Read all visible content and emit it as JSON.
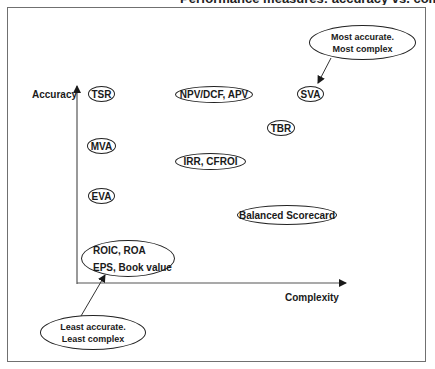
{
  "title_cropped": "Performance measures: accuracy vs. complexity",
  "axes": {
    "y_label": "Accuracy",
    "x_label": "Complexity"
  },
  "nodes": [
    {
      "id": "tsr",
      "label": "TSR"
    },
    {
      "id": "npv",
      "label": "NPV/DCF, APV"
    },
    {
      "id": "sva",
      "label": "SVA"
    },
    {
      "id": "tbr",
      "label": "TBR"
    },
    {
      "id": "mva",
      "label": "MVA"
    },
    {
      "id": "irr",
      "label": "IRR, CFROI"
    },
    {
      "id": "eva",
      "label": "EVA"
    },
    {
      "id": "bsc",
      "label": "Balanced Scorecard"
    },
    {
      "id": "roic",
      "lines": [
        "ROIC, ROA",
        "EPS, Book value"
      ]
    }
  ],
  "callouts": {
    "top": {
      "line1": "Most accurate.",
      "line2": "Most complex",
      "points_to": "SVA"
    },
    "bottom": {
      "line1": "Least accurate.",
      "line2": "Least complex",
      "points_to": "ROIC, ROA / EPS, Book value"
    }
  },
  "colors": {
    "frame": "#707070",
    "ink": "#1a1a1a",
    "background": "#ffffff"
  }
}
